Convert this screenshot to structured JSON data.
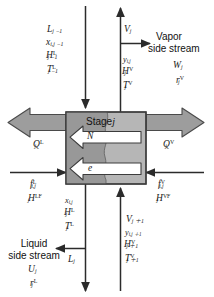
{
  "diagram": {
    "stage_box": {
      "label_text": "Stage",
      "label_index": "j",
      "fill_left": "#9a9a9a",
      "fill_right": "#b5b5b5",
      "stroke": "#3c3c3c"
    },
    "internal_arrows": [
      {
        "name": "mass-transfer-arrow",
        "label": "N"
      },
      {
        "name": "energy-transfer-arrow",
        "label": "e"
      }
    ],
    "streams": {
      "liquid_in_top": {
        "name": "liquid-inlet-from-stage-above",
        "labels": [
          "L",
          "x",
          "H",
          "T"
        ],
        "lines": [
          {
            "base": "L",
            "sub": "j −1",
            "sup": ""
          },
          {
            "base": "x",
            "sub": "i,j −1",
            "sup": ""
          },
          {
            "base": "H",
            "sub": "j −1",
            "sup": "L"
          },
          {
            "base": "T",
            "sub": "j −1",
            "sup": "L"
          }
        ]
      },
      "vapor_out_top": {
        "name": "vapor-outlet-to-stage-above",
        "lines": [
          {
            "base": "V",
            "sub": "j",
            "sup": ""
          }
        ]
      },
      "vapor_stream_props": {
        "name": "vapor-outlet-properties",
        "lines": [
          {
            "base": "y",
            "sub": "i,j",
            "sup": ""
          },
          {
            "base": "H",
            "sub": "j",
            "sup": "V"
          },
          {
            "base": "T",
            "sub": "j",
            "sup": "V"
          }
        ]
      },
      "vapor_side_stream": {
        "name": "vapor-side-stream",
        "caption_line1": "Vapor",
        "caption_line2": "side stream",
        "lines": [
          {
            "base": "W",
            "sub": "j",
            "sup": ""
          },
          {
            "base": "r",
            "sub": "j",
            "sup": "V"
          }
        ]
      },
      "heat_liquid": {
        "name": "liquid-phase-heat-transfer",
        "lines": [
          {
            "base": "Q",
            "sub": "j",
            "sup": "L"
          }
        ]
      },
      "heat_vapor": {
        "name": "vapor-phase-heat-transfer",
        "lines": [
          {
            "base": "Q",
            "sub": "j",
            "sup": "V"
          }
        ]
      },
      "feed_liquid": {
        "name": "liquid-feed-inlet",
        "lines": [
          {
            "base": "f",
            "sub": "i,j",
            "sup": "L"
          },
          {
            "base": "H",
            "sub": "j",
            "sup": "LF"
          }
        ]
      },
      "feed_vapor": {
        "name": "vapor-feed-inlet",
        "lines": [
          {
            "base": "f",
            "sub": "i,j",
            "sup": "V"
          },
          {
            "base": "H",
            "sub": "j",
            "sup": "VF"
          }
        ]
      },
      "liquid_out_bottom_props": {
        "name": "liquid-outlet-properties",
        "lines": [
          {
            "base": "x",
            "sub": "i,j",
            "sup": ""
          },
          {
            "base": "H",
            "sub": "j",
            "sup": "L"
          },
          {
            "base": "T",
            "sub": "j",
            "sup": "L"
          }
        ]
      },
      "liquid_out_bottom": {
        "name": "liquid-outlet-to-stage-below",
        "lines": [
          {
            "base": "L",
            "sub": "j",
            "sup": ""
          }
        ]
      },
      "vapor_in_bottom": {
        "name": "vapor-inlet-from-stage-below",
        "lines": [
          {
            "base": "V",
            "sub": "j ＋1",
            "sup": ""
          },
          {
            "base": "y",
            "sub": "i,j ＋1",
            "sup": ""
          },
          {
            "base": "H",
            "sub": "j ＋1",
            "sup": "V"
          },
          {
            "base": "T",
            "sub": "j ＋1",
            "sup": "V"
          }
        ]
      },
      "liquid_side_stream": {
        "name": "liquid-side-stream",
        "caption_line1": "Liquid",
        "caption_line2": "side stream",
        "lines": [
          {
            "base": "U",
            "sub": "j",
            "sup": ""
          },
          {
            "base": "r",
            "sub": "j",
            "sup": "L"
          }
        ]
      }
    },
    "colors": {
      "line": "#2b2b2b",
      "big_arrow_fill": "#9d9d9d",
      "big_arrow_stroke": "#4a4a4a",
      "white_arrow_fill": "#ffffff",
      "background": "#ffffff"
    }
  }
}
